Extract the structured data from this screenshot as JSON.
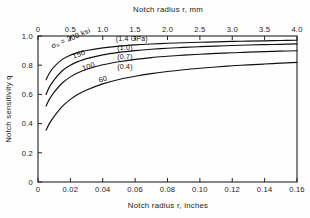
{
  "chart_data": {
    "type": "line",
    "title": "",
    "xlabel": "Notch radius r, inches",
    "xlabel_top": "Notch radius r, mm",
    "ylabel": "Notch sensitivity  q",
    "xlim": [
      0,
      0.16
    ],
    "ylim": [
      0,
      1.0
    ],
    "xlim_top": [
      0,
      4.0
    ],
    "grid": false,
    "legend_position": "inline-labels",
    "xticks": [
      "0",
      "0.02",
      "0.04",
      "0.06",
      "0.08",
      "0.10",
      "0.12",
      "0.14",
      "0.16"
    ],
    "xtick_values": [
      0,
      0.02,
      0.04,
      0.06,
      0.08,
      0.1,
      0.12,
      0.14,
      0.16
    ],
    "xticks_top": [
      "0",
      "0.5",
      "1.0",
      "1.5",
      "2.0",
      "2.5",
      "3.0",
      "3.5",
      "4.0"
    ],
    "xtick_top_values": [
      0,
      0.5,
      1.0,
      1.5,
      2.0,
      2.5,
      3.0,
      3.5,
      4.0
    ],
    "yticks": [
      "0",
      "0.2",
      "0.4",
      "0.6",
      "0.8",
      "1.0"
    ],
    "ytick_values": [
      0,
      0.2,
      0.4,
      0.6,
      0.8,
      1.0
    ],
    "x": [
      0.005,
      0.007,
      0.01,
      0.015,
      0.02,
      0.025,
      0.03,
      0.04,
      0.05,
      0.06,
      0.07,
      0.08,
      0.09,
      0.1,
      0.11,
      0.12,
      0.13,
      0.14,
      0.15,
      0.16
    ],
    "series": [
      {
        "name": "200 ksi (1.4 GPa)",
        "label_strength": "σᵤ = 200 ksi",
        "label_metric": "(1.4 GPa)",
        "values": [
          0.7,
          0.745,
          0.79,
          0.84,
          0.869,
          0.888,
          0.901,
          0.919,
          0.931,
          0.939,
          0.945,
          0.95,
          0.954,
          0.957,
          0.96,
          0.963,
          0.965,
          0.967,
          0.969,
          0.971
        ]
      },
      {
        "name": "150 ksi (1.0 GPa)",
        "label_strength": "150",
        "label_metric": "(1.0)",
        "values": [
          0.6,
          0.65,
          0.7,
          0.762,
          0.8,
          0.826,
          0.845,
          0.871,
          0.888,
          0.9,
          0.909,
          0.916,
          0.922,
          0.927,
          0.931,
          0.935,
          0.938,
          0.941,
          0.943,
          0.946
        ]
      },
      {
        "name": "100 ksi (0.7 GPa)",
        "label_strength": "100",
        "label_metric": "(0.7)",
        "values": [
          0.52,
          0.566,
          0.615,
          0.678,
          0.72,
          0.75,
          0.772,
          0.803,
          0.824,
          0.84,
          0.852,
          0.861,
          0.869,
          0.875,
          0.881,
          0.885,
          0.89,
          0.893,
          0.896,
          0.899
        ]
      },
      {
        "name": "60 ksi (0.4 GPa)",
        "label_strength": "60",
        "label_metric": "(0.4)",
        "values": [
          0.355,
          0.4,
          0.45,
          0.518,
          0.566,
          0.602,
          0.63,
          0.672,
          0.702,
          0.724,
          0.742,
          0.757,
          0.769,
          0.779,
          0.788,
          0.796,
          0.802,
          0.808,
          0.814,
          0.819
        ]
      }
    ],
    "annotations": [
      {
        "text": "σᵤ = 200 ksi",
        "x": 0.009,
        "y": 0.915,
        "rotate": -23
      },
      {
        "text": "(1.4 GPa)",
        "x": 0.048,
        "y": 0.965,
        "rotate": 0
      },
      {
        "text": "150",
        "x": 0.022,
        "y": 0.845,
        "rotate": -20
      },
      {
        "text": "(1.0)",
        "x": 0.049,
        "y": 0.905,
        "rotate": 0
      },
      {
        "text": "100",
        "x": 0.028,
        "y": 0.76,
        "rotate": -20
      },
      {
        "text": "(0.7)",
        "x": 0.049,
        "y": 0.843,
        "rotate": 0
      },
      {
        "text": "60",
        "x": 0.038,
        "y": 0.68,
        "rotate": -17
      },
      {
        "text": "(0.4)",
        "x": 0.049,
        "y": 0.775,
        "rotate": 0
      }
    ]
  }
}
